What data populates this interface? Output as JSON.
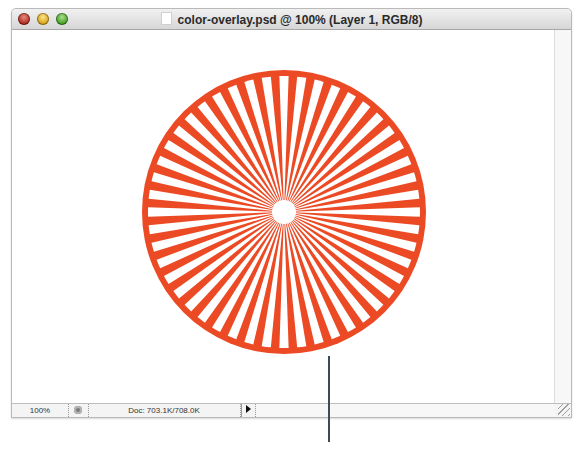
{
  "window": {
    "title": "color-overlay.psd @ 100% (Layer 1, RGB/8)",
    "buttons": [
      "close",
      "minimize",
      "zoom"
    ]
  },
  "statusbar": {
    "zoom_level": "100%",
    "doc_info": "Doc: 703.1K/708.0K",
    "menu_arrow_icon": "triangle-right"
  },
  "artwork": {
    "type": "sunburst-circle",
    "color": "#ec4a24",
    "center": [
      284,
      212
    ],
    "radius": 142,
    "ring_width": 6,
    "ray_count": 48,
    "core_radius": 12
  },
  "callout": {
    "color": "#3d4a57"
  }
}
